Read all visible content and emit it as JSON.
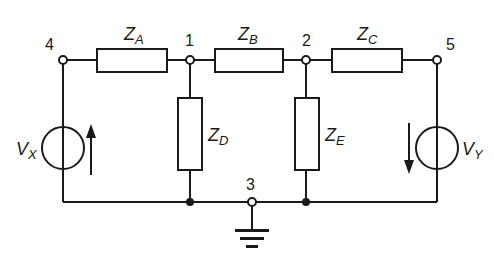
{
  "diagram": {
    "type": "circuit-schematic",
    "colors": {
      "line": "#1a1a1a",
      "background": "#ffffff"
    },
    "nodes": [
      {
        "id": "4",
        "label": "4",
        "x": 63,
        "y": 60,
        "style": "open"
      },
      {
        "id": "1",
        "label": "1",
        "x": 190,
        "y": 60,
        "style": "open"
      },
      {
        "id": "2",
        "label": "2",
        "x": 306,
        "y": 60,
        "style": "open"
      },
      {
        "id": "5",
        "label": "5",
        "x": 437,
        "y": 60,
        "style": "open"
      },
      {
        "id": "3",
        "label": "3",
        "x": 252,
        "y": 202,
        "style": "open"
      }
    ],
    "impedances": [
      {
        "name": "Z_A",
        "main": "Z",
        "sub": "A",
        "between": [
          "4",
          "1"
        ],
        "orientation": "horizontal"
      },
      {
        "name": "Z_B",
        "main": "Z",
        "sub": "B",
        "between": [
          "1",
          "2"
        ],
        "orientation": "horizontal"
      },
      {
        "name": "Z_C",
        "main": "Z",
        "sub": "C",
        "between": [
          "2",
          "5"
        ],
        "orientation": "horizontal"
      },
      {
        "name": "Z_D",
        "main": "Z",
        "sub": "D",
        "between": [
          "1",
          "3"
        ],
        "orientation": "vertical"
      },
      {
        "name": "Z_E",
        "main": "Z",
        "sub": "E",
        "between": [
          "2",
          "3"
        ],
        "orientation": "vertical"
      }
    ],
    "sources": [
      {
        "name": "V_X",
        "main": "V",
        "sub": "X",
        "between": [
          "4",
          "3"
        ],
        "arrow": "up"
      },
      {
        "name": "V_Y",
        "main": "V",
        "sub": "Y",
        "between": [
          "5",
          "3"
        ],
        "arrow": "down"
      }
    ],
    "ground": {
      "node": "3"
    }
  }
}
